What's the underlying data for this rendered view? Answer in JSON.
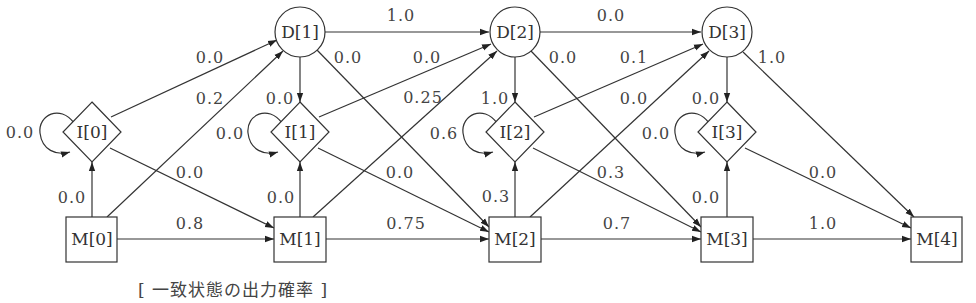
{
  "diagram": {
    "caption": "[ 一致状態の出力確率 ]",
    "nodes": {
      "D1": {
        "label": "D[1]",
        "shape": "circle",
        "cx": 300,
        "cy": 32
      },
      "D2": {
        "label": "D[2]",
        "shape": "circle",
        "cx": 515,
        "cy": 32
      },
      "D3": {
        "label": "D[3]",
        "shape": "circle",
        "cx": 727,
        "cy": 32
      },
      "I0": {
        "label": "I[0]",
        "shape": "diamond",
        "cx": 92,
        "cy": 132
      },
      "I1": {
        "label": "I[1]",
        "shape": "diamond",
        "cx": 300,
        "cy": 132
      },
      "I2": {
        "label": "I[2]",
        "shape": "diamond",
        "cx": 515,
        "cy": 132
      },
      "I3": {
        "label": "I[3]",
        "shape": "diamond",
        "cx": 727,
        "cy": 132
      },
      "M0": {
        "label": "M[0]",
        "shape": "box",
        "cx": 92,
        "cy": 239
      },
      "M1": {
        "label": "M[1]",
        "shape": "box",
        "cx": 300,
        "cy": 239
      },
      "M2": {
        "label": "M[2]",
        "shape": "box",
        "cx": 515,
        "cy": 239
      },
      "M3": {
        "label": "M[3]",
        "shape": "box",
        "cx": 727,
        "cy": 239
      },
      "M4": {
        "label": "M[4]",
        "shape": "box",
        "cx": 937,
        "cy": 239
      }
    },
    "edges": [
      {
        "from": "I0",
        "to": "I0",
        "label": "0.0"
      },
      {
        "from": "I0",
        "to": "D1",
        "label": "0.0"
      },
      {
        "from": "M0",
        "to": "D1",
        "label": "0.2"
      },
      {
        "from": "I0",
        "to": "M1",
        "label": "0.0"
      },
      {
        "from": "M0",
        "to": "I0",
        "label": "0.0"
      },
      {
        "from": "M0",
        "to": "M1",
        "label": "0.8"
      },
      {
        "from": "D1",
        "to": "D2",
        "label": "1.0"
      },
      {
        "from": "D1",
        "to": "M2",
        "label": "0.0"
      },
      {
        "from": "D1",
        "to": "I1",
        "label": "0.0"
      },
      {
        "from": "I1",
        "to": "I1",
        "label": "0.0"
      },
      {
        "from": "I1",
        "to": "D2",
        "label": "0.0"
      },
      {
        "from": "M1",
        "to": "D2",
        "label": "0.25"
      },
      {
        "from": "I1",
        "to": "M2",
        "label": "0.0"
      },
      {
        "from": "M1",
        "to": "I1",
        "label": "0.0"
      },
      {
        "from": "M1",
        "to": "M2",
        "label": "0.75"
      },
      {
        "from": "D2",
        "to": "D3",
        "label": "0.0"
      },
      {
        "from": "D2",
        "to": "M3",
        "label": "0.0"
      },
      {
        "from": "D2",
        "to": "I2",
        "label": "1.0"
      },
      {
        "from": "I2",
        "to": "I2",
        "label": "0.6"
      },
      {
        "from": "I2",
        "to": "D3",
        "label": "0.1"
      },
      {
        "from": "M2",
        "to": "D3",
        "label": "0.0"
      },
      {
        "from": "I2",
        "to": "M3",
        "label": "0.3"
      },
      {
        "from": "M2",
        "to": "I2",
        "label": "0.3"
      },
      {
        "from": "M2",
        "to": "M3",
        "label": "0.7"
      },
      {
        "from": "D3",
        "to": "M4",
        "label": "1.0"
      },
      {
        "from": "D3",
        "to": "I3",
        "label": "0.0"
      },
      {
        "from": "I3",
        "to": "I3",
        "label": "0.0"
      },
      {
        "from": "I3",
        "to": "M4",
        "label": "0.0"
      },
      {
        "from": "M3",
        "to": "I3",
        "label": "0.0"
      },
      {
        "from": "M3",
        "to": "M4",
        "label": "1.0"
      }
    ]
  }
}
